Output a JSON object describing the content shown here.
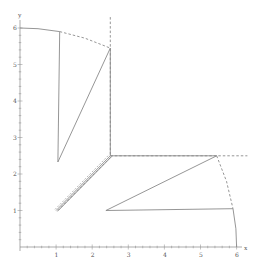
{
  "chart_data": {
    "type": "line",
    "title": "",
    "xlabel": "x",
    "ylabel": "y",
    "xlim": [
      0,
      6.2
    ],
    "ylim": [
      0,
      6.3
    ],
    "x_ticks": [
      1,
      2,
      3,
      4,
      5,
      6
    ],
    "y_ticks": [
      1,
      2,
      3,
      4,
      5,
      6
    ],
    "grid": false,
    "legend": null,
    "series": [
      {
        "name": "upper-boundary-solid",
        "style": "solid",
        "points": [
          [
            0,
            6.0
          ],
          [
            0.5,
            5.98
          ],
          [
            1.1,
            5.9
          ]
        ]
      },
      {
        "name": "upper-boundary-dashed",
        "style": "dashed",
        "points": [
          [
            1.1,
            5.9
          ],
          [
            1.8,
            5.72
          ],
          [
            2.5,
            5.45
          ]
        ]
      },
      {
        "name": "upper-vertical-dashed",
        "style": "dashed",
        "points": [
          [
            2.5,
            6.3
          ],
          [
            2.5,
            2.5
          ]
        ]
      },
      {
        "name": "upper-triangle",
        "style": "solid",
        "points": [
          [
            1.1,
            5.9
          ],
          [
            1.05,
            2.33
          ],
          [
            2.5,
            5.45
          ],
          [
            2.5,
            2.5
          ]
        ]
      },
      {
        "name": "diagonal-band-solid",
        "style": "solid",
        "points": [
          [
            1.0,
            1.0
          ],
          [
            2.5,
            2.5
          ]
        ]
      },
      {
        "name": "diagonal-band-dashed",
        "style": "dashed",
        "points": [
          [
            1.05,
            1.0
          ],
          [
            2.55,
            2.5
          ]
        ]
      },
      {
        "name": "right-horizontal-dashed",
        "style": "dashed",
        "points": [
          [
            2.5,
            2.5
          ],
          [
            6.3,
            2.5
          ]
        ]
      },
      {
        "name": "lower-triangle",
        "style": "solid",
        "points": [
          [
            2.5,
            2.5
          ],
          [
            5.45,
            2.5
          ],
          [
            2.38,
            1.0
          ],
          [
            5.9,
            1.05
          ]
        ]
      },
      {
        "name": "right-boundary-dashed",
        "style": "dashed",
        "points": [
          [
            5.45,
            2.5
          ],
          [
            5.72,
            1.8
          ],
          [
            5.9,
            1.05
          ]
        ]
      },
      {
        "name": "right-boundary-solid",
        "style": "solid",
        "points": [
          [
            5.9,
            1.05
          ],
          [
            5.98,
            0.5
          ],
          [
            6.0,
            0.0
          ]
        ]
      }
    ]
  },
  "axes": {
    "x_label": "x",
    "y_label": "y",
    "x_tick_labels": [
      "1",
      "2",
      "3",
      "4",
      "5",
      "6"
    ],
    "y_tick_labels": [
      "1",
      "2",
      "3",
      "4",
      "5",
      "6"
    ]
  },
  "colors": {
    "line": "#8a8a8a",
    "axis": "#888888",
    "text": "#555555"
  }
}
